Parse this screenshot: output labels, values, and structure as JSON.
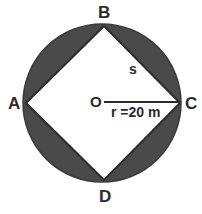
{
  "figure": {
    "type": "geometry-diagram",
    "background_color": "#ffffff",
    "shaded_color": "#4a4a4a",
    "stroke_color": "#2b2b2b",
    "inner_fill": "#ffffff"
  },
  "circle": {
    "center_label": "O",
    "center_x": 102,
    "center_y": 103,
    "radius_px": 79,
    "radius_label": "r =20 m",
    "radius_value": 20,
    "radius_unit": "m"
  },
  "square": {
    "name": "ABCD",
    "side_label": "s",
    "vertices": [
      {
        "label": "B",
        "x": 104,
        "y": 26
      },
      {
        "label": "C",
        "x": 180,
        "y": 103
      },
      {
        "label": "D",
        "x": 104,
        "y": 180
      },
      {
        "label": "A",
        "x": 26,
        "y": 103
      }
    ]
  },
  "labels": {
    "A": "A",
    "B": "B",
    "C": "C",
    "D": "D",
    "O": "O",
    "s": "s",
    "radius": "r =20 m"
  }
}
